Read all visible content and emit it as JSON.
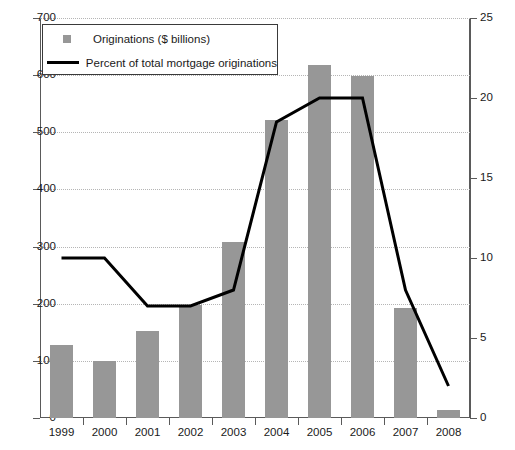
{
  "chart_data": {
    "type": "bar",
    "title": "",
    "xlabel": "",
    "ylabel": "",
    "categories": [
      "1999",
      "2000",
      "2001",
      "2002",
      "2003",
      "2004",
      "2005",
      "2006",
      "2007",
      "2008"
    ],
    "series": [
      {
        "name": "Originations ($ billions)",
        "type": "bar",
        "axis": "left",
        "color": "#979797",
        "values": [
          128,
          100,
          152,
          197,
          308,
          522,
          618,
          598,
          193,
          14
        ]
      },
      {
        "name": "Percent of total mortgage originations",
        "type": "line",
        "axis": "right",
        "color": "#000000",
        "values": [
          10,
          10,
          7,
          7,
          8,
          18.5,
          20,
          20,
          8,
          2
        ]
      }
    ],
    "ylim": [
      0,
      700
    ],
    "yticks": [
      0,
      100,
      200,
      300,
      400,
      500,
      600,
      700
    ],
    "y2lim": [
      0,
      25
    ],
    "y2ticks": [
      0,
      5,
      10,
      15,
      20,
      25
    ],
    "grid": true,
    "legend_position": "top-left",
    "legend": [
      "Originations ($ billions)",
      "Percent of total mortgage originations"
    ]
  },
  "axes": {
    "left_ticks": [
      "0",
      "100",
      "200",
      "300",
      "400",
      "500",
      "600",
      "700"
    ],
    "right_ticks": [
      "0",
      "5",
      "10",
      "15",
      "20",
      "25"
    ],
    "x_ticks": [
      "1999",
      "2000",
      "2001",
      "2002",
      "2003",
      "2004",
      "2005",
      "2006",
      "2007",
      "2008"
    ]
  },
  "legend": {
    "bar_label": "Originations ($ billions)",
    "line_label": "Percent of total mortgage originations"
  }
}
